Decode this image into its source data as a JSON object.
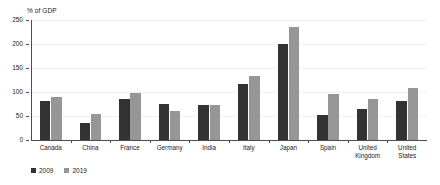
{
  "chart_data": {
    "type": "bar",
    "title": "",
    "ylabel": "% of GDP",
    "xlabel": "",
    "ylim": [
      0,
      250
    ],
    "yticks": [
      0,
      50,
      100,
      150,
      200,
      250
    ],
    "grid": true,
    "legend_position": "bottom-left",
    "categories": [
      "Canada",
      "China",
      "France",
      "Germany",
      "India",
      "Italy",
      "Japan",
      "Spain",
      "United\nKingdom",
      "United\nStates"
    ],
    "series": [
      {
        "name": "2009",
        "color": "#333333",
        "values": [
          81,
          36,
          85,
          75,
          72,
          116,
          199,
          53,
          64,
          82
        ]
      },
      {
        "name": "2019",
        "color": "#969696",
        "values": [
          90,
          54,
          98,
          60,
          72,
          134,
          235,
          95,
          85,
          108
        ]
      }
    ]
  },
  "colors": {
    "series_2009": "#333333",
    "series_2019": "#969696",
    "axis": "#4d4d4d",
    "grid": "#f0f0f0",
    "background": "#ffffff"
  }
}
